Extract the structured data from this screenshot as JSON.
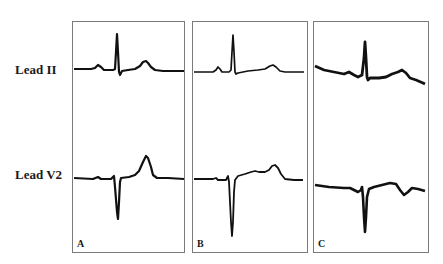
{
  "figure": {
    "row_labels": [
      "Lead II",
      "Lead V2"
    ],
    "panels": [
      {
        "letter": "A",
        "lead_ii": "normal sinus complex: small P wave, tall narrow R, upright T",
        "lead_v2": "rS complex with deep narrow S and tall upright T"
      },
      {
        "letter": "B",
        "lead_ii": "small P wave, tall narrow R, low broad T",
        "lead_v2": "very deep narrow QS/S wave with elevated ST and upright T"
      },
      {
        "letter": "C",
        "lead_ii": "sloping baseline, tall narrow R, broad T with downward drift",
        "lead_v2": "deep narrow S wave, elevated ST, notched/inverted terminal T"
      }
    ],
    "colors": {
      "trace": "#111111",
      "border": "#7a7a7a",
      "background": "#ffffff"
    }
  }
}
